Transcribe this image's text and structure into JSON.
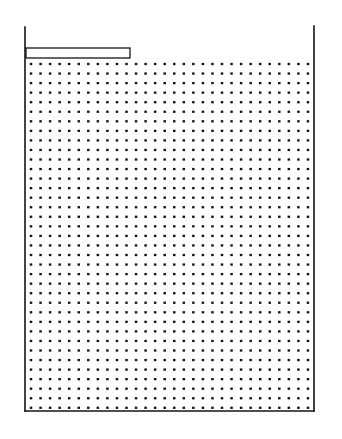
{
  "figure": {
    "title": "",
    "caption": "",
    "background_color": "#ffffff",
    "ink_color": "#141414",
    "width": 342,
    "height": 439
  },
  "chart_data": {
    "type": "scatter",
    "subtype": "vector-field-quiver",
    "title": "",
    "subtitle": "",
    "xlabel": "",
    "ylabel": "",
    "legend": [],
    "annotations": [],
    "grid": false,
    "axis_visible": false,
    "tick_labels_x": [],
    "tick_labels_y": [],
    "xlim": [
      25,
      314
    ],
    "ylim": [
      27,
      411
    ],
    "domain": {
      "x_left_wall": 25,
      "x_right_wall": 314,
      "y_top_open": 27,
      "y_bottom_wall": 411
    },
    "grid_spec": {
      "origin_x": 31,
      "origin_y": 64,
      "spacing_x": 9.55,
      "spacing_y": 9.55,
      "columns": 30,
      "rows": 37,
      "marker": "arrow-with-dot-tail",
      "arrow_scale_px_per_unit": 26,
      "min_drawn_length_px": 2.4,
      "max_drawn_length_px": 26
    },
    "geometry": [
      {
        "name": "left-wall",
        "shape": "line",
        "x1": 25,
        "y1": 27,
        "x2": 25,
        "y2": 411,
        "stroke_width": 1.6
      },
      {
        "name": "right-wall",
        "shape": "line",
        "x1": 314,
        "y1": 26,
        "x2": 314,
        "y2": 411,
        "stroke_width": 1.6
      },
      {
        "name": "bottom-wall",
        "shape": "line",
        "x1": 25,
        "y1": 411,
        "x2": 314,
        "y2": 411,
        "stroke_width": 1.6
      },
      {
        "name": "inlet-baffle-plate",
        "shape": "rect",
        "x": 26,
        "y": 48,
        "width": 104,
        "height": 10,
        "fill": "#ffffff",
        "stroke_width": 1.3
      }
    ],
    "flow_features": [
      {
        "name": "inlet-wall-jet",
        "region": "beneath baffle, upper-left",
        "direction": "rightward",
        "x_range": [
          26,
          132
        ],
        "y_range": [
          58,
          78
        ],
        "relative_speed": 1.0
      },
      {
        "name": "jet-separation-and-plunge",
        "region": "at baffle tip",
        "direction": "down-right then down",
        "x_range": [
          125,
          150
        ],
        "y_range": [
          58,
          110
        ],
        "relative_speed": 0.8
      },
      {
        "name": "primary-recirculation-cell",
        "region": "left two thirds of tank",
        "rotation": "clockwise",
        "center_x": 120,
        "center_y": 230,
        "relative_speed": 0.35
      },
      {
        "name": "upper-left-return-eddy",
        "region": "corner below baffle",
        "rotation": "clockwise",
        "center_x": 62,
        "center_y": 80,
        "relative_speed": 0.6
      },
      {
        "name": "left-wall-upflow",
        "region": "along left wall",
        "direction": "upward",
        "x_range": [
          26,
          48
        ],
        "y_range": [
          90,
          400
        ],
        "relative_speed": 0.55
      },
      {
        "name": "floor-jet",
        "region": "along bottom wall",
        "direction": "leftward",
        "x_range": [
          60,
          300
        ],
        "y_range": [
          392,
          410
        ],
        "relative_speed": 0.85
      },
      {
        "name": "right-wall-downflow",
        "region": "along right wall",
        "direction": "downward",
        "x_range": [
          292,
          313
        ],
        "y_range": [
          60,
          400
        ],
        "relative_speed": 0.3
      },
      {
        "name": "quiescent-core",
        "region": "upper right interior",
        "direction": "near-stagnant",
        "x_range": [
          180,
          300
        ],
        "y_range": [
          60,
          260
        ],
        "relative_speed": 0.05
      }
    ]
  }
}
